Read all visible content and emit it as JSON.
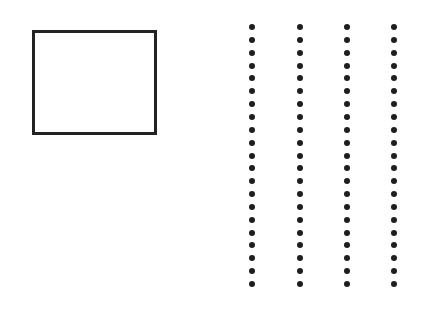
{
  "figure": {
    "shapes": [
      {
        "type": "rectangle",
        "name": "outlined-rectangle",
        "stroke": "#222222"
      }
    ],
    "dot_columns": {
      "count": 4,
      "dots_per_column": 21,
      "x_positions": [
        252,
        300,
        347,
        394
      ],
      "first_y": 27,
      "spacing": 12.85,
      "color": "#1e1e1e"
    }
  }
}
